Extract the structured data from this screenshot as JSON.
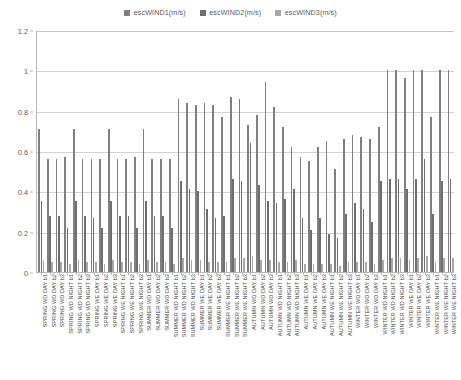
{
  "chart_data": {
    "type": "bar",
    "title": "",
    "subtitle": "",
    "xlabel": "",
    "ylabel": "",
    "ylim": [
      0,
      1.2
    ],
    "yticks": [
      "0",
      "0.2",
      "0.4",
      "0.6",
      "0.8",
      "1",
      "1.2"
    ],
    "ytick_values": [
      0,
      0.2,
      0.4,
      0.6,
      0.8,
      1.0,
      1.2
    ],
    "grid": true,
    "legend_position": "top-center",
    "orientation": "vertical",
    "xtick_rotation": -90,
    "categories": [
      "SPRING WD DAY b1",
      "SPRING WD DAY b2",
      "SPRING WD DAY b3",
      "SPRING WD NIGHT b1",
      "SPRING WD NIGHT b2",
      "SPRING WD NIGHT b3",
      "SPRING WE DAY b1",
      "SPRING WE DAY b2",
      "SPRING WE DAY b3",
      "SPRING WE NIGHT b1",
      "SPRING WE NIGHT b2",
      "SPRING WE NIGHT b3",
      "SUMMER WD DAY b1",
      "SUMMER WD DAY b2",
      "SUMMER WD DAY b3",
      "SUMMER WD NIGHT b1",
      "SUMMER WD NIGHT b2",
      "SUMMER WD NIGHT b3",
      "SUMMER WE DAY b1",
      "SUMMER WE DAY b2",
      "SUMMER WE DAY b3",
      "SUMMER WE NIGHT b1",
      "SUMMER WE NIGHT b2",
      "SUMMER WE NIGHT b3",
      "AUTUMN WD DAY b1",
      "AUTUMN WD DAY b2",
      "AUTUMN WD DAY b3",
      "AUTUMN WD NIGHT b1",
      "AUTUMN WD NIGHT b2",
      "AUTUMN WD NIGHT b3",
      "AUTUMN WE DAY b1",
      "AUTUMN WE DAY b2",
      "AUTUMN WE DAY b3",
      "AUTUMN WE NIGHT b1",
      "AUTUMN WE NIGHT b2",
      "AUTUMN WE NIGHT b3",
      "WINTER WD DAY b1",
      "WINTER WD DAY b2",
      "WINTER WD DAY b3",
      "WINTER WD NIGHT b1",
      "WINTER WD NIGHT b2",
      "WINTER WD NIGHT b3",
      "WINTER WE DAY b1",
      "WINTER WE DAY b2",
      "WINTER WE DAY b3",
      "WINTER WE NIGHT b1",
      "WINTER WE NIGHT b2",
      "WINTER WE NIGHT b3"
    ],
    "series": [
      {
        "name": "escWIND1(m/s)",
        "color": "#808080",
        "values": [
          0.71,
          0.56,
          0.56,
          0.57,
          0.71,
          0.56,
          0.56,
          0.56,
          0.71,
          0.56,
          0.56,
          0.57,
          0.71,
          0.56,
          0.56,
          0.56,
          0.86,
          0.84,
          0.83,
          0.84,
          0.83,
          0.77,
          0.87,
          0.86,
          0.73,
          0.78,
          0.94,
          0.82,
          0.72,
          0.62,
          0.57,
          0.55,
          0.62,
          0.65,
          0.51,
          0.66,
          0.68,
          0.67,
          0.66,
          0.72,
          1.0,
          1.0,
          0.96,
          1.0,
          1.0,
          0.77,
          1.0,
          1.0
        ]
      },
      {
        "name": "escWIND2(m/s)",
        "color": "#6e6e6e",
        "values": [
          0.35,
          0.28,
          0.28,
          0.22,
          0.35,
          0.28,
          0.27,
          0.22,
          0.35,
          0.28,
          0.28,
          0.22,
          0.35,
          0.28,
          0.28,
          0.22,
          0.45,
          0.41,
          0.4,
          0.31,
          0.27,
          0.28,
          0.46,
          0.45,
          0.64,
          0.43,
          0.35,
          0.34,
          0.36,
          0.41,
          0.27,
          0.21,
          0.27,
          0.19,
          0.17,
          0.29,
          0.34,
          0.31,
          0.25,
          0.45,
          0.46,
          0.46,
          0.41,
          0.46,
          0.56,
          0.29,
          0.45,
          0.46
        ]
      },
      {
        "name": "escWIND3(m/s)",
        "color": "#a8a8a8",
        "values": [
          0.06,
          0.05,
          0.05,
          0.04,
          0.06,
          0.05,
          0.05,
          0.04,
          0.06,
          0.05,
          0.05,
          0.04,
          0.06,
          0.05,
          0.05,
          0.04,
          0.07,
          0.06,
          0.06,
          0.05,
          0.05,
          0.05,
          0.07,
          0.07,
          0.08,
          0.06,
          0.06,
          0.05,
          0.05,
          0.06,
          0.04,
          0.04,
          0.04,
          0.04,
          0.03,
          0.05,
          0.05,
          0.05,
          0.04,
          0.06,
          0.07,
          0.07,
          0.06,
          0.07,
          0.08,
          0.05,
          0.07,
          0.07
        ]
      }
    ]
  },
  "legend": {
    "items": [
      {
        "label": "escWIND1(m/s)",
        "color": "#808080"
      },
      {
        "label": "escWIND2(m/s)",
        "color": "#6e6e6e"
      },
      {
        "label": "escWIND3(m/s)",
        "color": "#a8a8a8"
      }
    ]
  },
  "axes": {
    "y_max": 1.2,
    "y_min": 0
  }
}
